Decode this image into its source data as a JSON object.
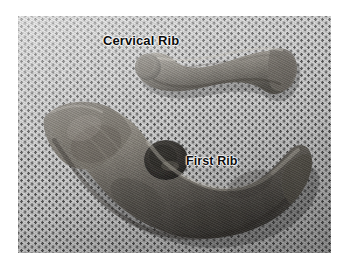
{
  "figure": {
    "media_type": "photograph",
    "color_mode": "black-and-white",
    "background_surface": "perforated dotted mat",
    "page_background_color": "#ffffff",
    "photo": {
      "x": 18,
      "y": 16,
      "width": 313,
      "height": 237,
      "base_color": "#cfcfcf",
      "dot_color": "#4a4a4a"
    }
  },
  "labels": {
    "cervical_rib": "Cervical Rib",
    "first_rib": "First Rib"
  },
  "specimens": [
    {
      "id": "cervical-rib",
      "label": "Cervical Rib",
      "description": "small elongated slightly curved bone with rounded head at left and flared blade at right",
      "position": "upper right of photograph",
      "bone_color": "#8e8a82"
    },
    {
      "id": "first-rib",
      "label": "First Rib",
      "description": "large C-shaped crescent bone with broad flat end at left, prominent rounded tubercle at upper centre, and tapering shaft sweeping down and to the right",
      "position": "lower centre of photograph",
      "bone_color": "#918d85"
    }
  ]
}
